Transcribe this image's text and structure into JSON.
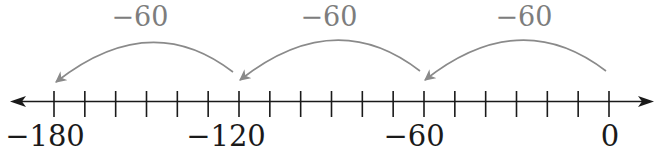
{
  "diagram": {
    "type": "number-line",
    "axis": {
      "min": -180,
      "max": 0,
      "tick_step": 10,
      "tick_count": 19,
      "left_arrow": true,
      "right_arrow": true,
      "color": "#1a1a1a"
    },
    "labels": [
      {
        "value": -180,
        "text": "−180"
      },
      {
        "value": -120,
        "text": "−120"
      },
      {
        "value": -60,
        "text": "−60"
      },
      {
        "value": 0,
        "text": "0"
      }
    ],
    "jumps": [
      {
        "from": 0,
        "to": -60,
        "label": "−60"
      },
      {
        "from": -60,
        "to": -120,
        "label": "−60"
      },
      {
        "from": -120,
        "to": -180,
        "label": "−60"
      }
    ],
    "colors": {
      "axis": "#1a1a1a",
      "jump_arrows": "#8a8a8a",
      "jump_labels": "#7d7d7d"
    }
  }
}
